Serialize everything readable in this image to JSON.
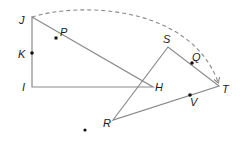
{
  "diagram": {
    "colors": {
      "line": "#8a8a8a",
      "dash": "#8a8a8a",
      "point": "#111111",
      "label": "#1a1a1a"
    },
    "triangle_jih": {
      "vertices": {
        "J": "J",
        "I": "I",
        "H": "H"
      },
      "points_on_sides": {
        "K": "K",
        "P": "P"
      }
    },
    "triangle_srt": {
      "vertices": {
        "S": "S",
        "R": "R",
        "T": "T"
      },
      "points_on_sides": {
        "Q": "Q",
        "V": "V"
      }
    },
    "arc": {
      "from": "J",
      "to": "T",
      "style": "dashed arrow"
    }
  }
}
